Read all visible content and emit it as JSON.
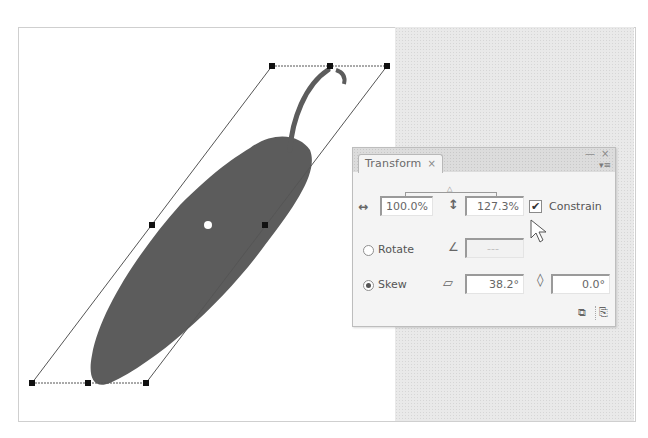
{
  "canvas": {
    "artboard_color": "#ffffff",
    "pasteboard_color": "#e9e9e9",
    "object": "chili-pepper",
    "object_color": "#5a5a5a",
    "bounding_box": {
      "handles_top": [
        [
          272,
          66
        ],
        [
          330,
          66
        ],
        [
          387,
          66
        ]
      ],
      "handles_middle": [
        [
          152,
          225
        ],
        [
          265,
          225
        ]
      ],
      "handles_bottom": [
        [
          32,
          383
        ],
        [
          88,
          383
        ],
        [
          146,
          383
        ]
      ],
      "center_point": [
        208,
        225
      ]
    }
  },
  "panel": {
    "tab_label": "Transform",
    "tab_close": "×",
    "minimize": "—",
    "close": "×",
    "menu_icon": "▾≡",
    "scale": {
      "horizontal_icon": "↔",
      "horizontal_value": "100.0%",
      "vertical_icon": "↕",
      "vertical_value": "127.3%",
      "constrain_checked": true,
      "constrain_label": "Constrain",
      "check_mark": "✔"
    },
    "rotate": {
      "selected": false,
      "label": "Rotate",
      "icon": "∠",
      "value": "---"
    },
    "skew": {
      "selected": true,
      "label": "Skew",
      "horizontal_icon": "⏥",
      "horizontal_value": "38.2°",
      "vertical_icon": "◊",
      "vertical_value": "0.0°"
    },
    "footer_buttons": [
      {
        "name": "duplicate-selection",
        "glyph": "⧉"
      },
      {
        "name": "reset-transform",
        "glyph": "⎘"
      }
    ]
  }
}
